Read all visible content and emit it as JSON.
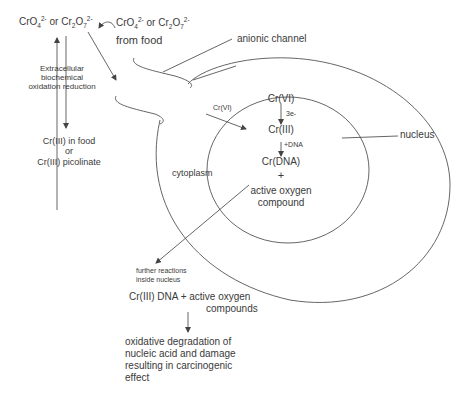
{
  "diagram": {
    "top_left_species": {
      "base": "CrO",
      "sub1": "4",
      "sup1": "2-",
      "or": " or ",
      "base2": "Cr",
      "sub2": "2",
      "base3": "O",
      "sub3": "7",
      "sup3": "2-"
    },
    "food_species": {
      "base": "CrO",
      "sub1": "4",
      "sup1": "2-",
      "or": " or ",
      "base2": "Cr",
      "sub2": "2",
      "base3": "O",
      "sub3": "7",
      "sup3": "2-",
      "line2": "from food"
    },
    "extracellular_label": [
      "Extracellular",
      "biochemical",
      "oxidation reduction"
    ],
    "cr3_label": [
      "Cr(III) in food",
      "or",
      "Cr(III) picolinate"
    ],
    "anionic_channel_label": "anionic channel",
    "nucleus_label": "nucleus",
    "cytoplasm_label": "cytoplasm",
    "entry_label": "Cr(VI)",
    "nuclear_chain": {
      "step1": "Cr(VI)",
      "arrow1_label": "3e-",
      "step2": "Cr(III)",
      "arrow2_label": "+DNA",
      "step3": "Cr(DNA)",
      "plus": "+",
      "step4": [
        "active oxygen",
        "compound"
      ]
    },
    "further_label": [
      "further reactions",
      "inside nucleus"
    ],
    "product_label": [
      "Cr(III) DNA + active oxygen",
      "compounds"
    ],
    "outcome_label": [
      "oxidative degradation of",
      "nucleic acid and damage",
      "resulting in carcinogenic",
      "effect"
    ]
  }
}
